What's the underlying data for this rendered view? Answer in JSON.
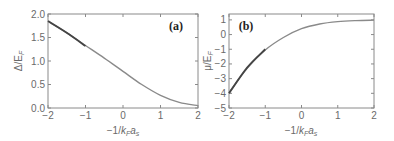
{
  "chart_data": [
    {
      "id": "a",
      "type": "line",
      "panel_label": "(a)",
      "title": "",
      "xlabel": "−1/k_F a_s",
      "xlabel_display": "−1/kFas",
      "ylabel": "Δ/E_F",
      "ylabel_display": "Δ/EF",
      "xlim": [
        -2,
        2
      ],
      "ylim": [
        0,
        2
      ],
      "xticks": [
        "-2",
        "-1",
        "0",
        "1",
        "2"
      ],
      "yticks": [
        "0.0",
        "0.5",
        "1.0",
        "1.5",
        "2.0"
      ],
      "grid": false,
      "series": [
        {
          "name": "Δ/E_F (full)",
          "color": "#8a8a8a",
          "x": [
            -2,
            -1.5,
            -1,
            -0.5,
            0,
            0.5,
            1,
            1.5,
            2
          ],
          "y": [
            1.84,
            1.6,
            1.33,
            1.06,
            0.78,
            0.5,
            0.27,
            0.12,
            0.05
          ]
        },
        {
          "name": "Δ/E_F (BEC asymptote)",
          "color": "#444444",
          "x": [
            -2,
            -1.5,
            -1
          ],
          "y": [
            1.85,
            1.6,
            1.32
          ]
        }
      ]
    },
    {
      "id": "b",
      "type": "line",
      "panel_label": "(b)",
      "title": "",
      "xlabel": "−1/k_F a_s",
      "xlabel_display": "−1/kFas",
      "ylabel": "μ/E_F",
      "ylabel_display": "μ/EF",
      "xlim": [
        -2,
        2
      ],
      "ylim": [
        -5,
        1.4
      ],
      "xticks": [
        "-2",
        "-1",
        "0",
        "1",
        "2"
      ],
      "yticks": [
        "-5",
        "-4",
        "-3",
        "-2",
        "-1",
        "0",
        "1"
      ],
      "grid": false,
      "series": [
        {
          "name": "μ/E_F (full)",
          "color": "#8a8a8a",
          "x": [
            -2,
            -1.5,
            -1,
            -0.5,
            0,
            0.5,
            1,
            1.5,
            2
          ],
          "y": [
            -3.95,
            -2.3,
            -1.05,
            -0.2,
            0.4,
            0.72,
            0.88,
            0.95,
            0.98
          ]
        },
        {
          "name": "μ/E_F (BEC asymptote)",
          "color": "#444444",
          "x": [
            -2,
            -1.5,
            -1
          ],
          "y": [
            -4.0,
            -2.25,
            -1.0
          ]
        }
      ]
    }
  ]
}
